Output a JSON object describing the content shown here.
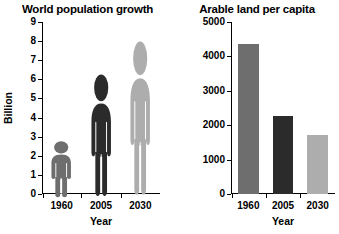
{
  "chart_data": [
    {
      "type": "bar",
      "variant": "pictogram",
      "title": "World population growth",
      "xlabel": "Year",
      "ylabel": "Billion",
      "categories": [
        "1960",
        "2005",
        "2030"
      ],
      "values": [
        3.0,
        6.5,
        8.2
      ],
      "ylim": [
        0,
        9
      ],
      "yticks": [
        0,
        1,
        2,
        3,
        4,
        5,
        6,
        7,
        8,
        9
      ],
      "ytick_labels": [
        "0",
        "1",
        "2",
        "3",
        "4",
        "5",
        "6",
        "7",
        "8",
        "9"
      ],
      "grid": false,
      "legend": "none",
      "colors": [
        "#6e6e6e",
        "#2b2b2b",
        "#adadad"
      ]
    },
    {
      "type": "bar",
      "title": "Arable land per capita",
      "xlabel": "Year",
      "ylabel": "Square metres",
      "categories": [
        "1960",
        "2005",
        "2030"
      ],
      "values": [
        4350,
        2280,
        1720
      ],
      "ylim": [
        0,
        5000
      ],
      "yticks": [
        0,
        1000,
        2000,
        3000,
        4000,
        5000
      ],
      "ytick_labels": [
        "0",
        "1000",
        "2000",
        "3000",
        "4000",
        "5000"
      ],
      "grid": false,
      "legend": "none",
      "colors": [
        "#6e6e6e",
        "#2b2b2b",
        "#adadad"
      ]
    }
  ]
}
